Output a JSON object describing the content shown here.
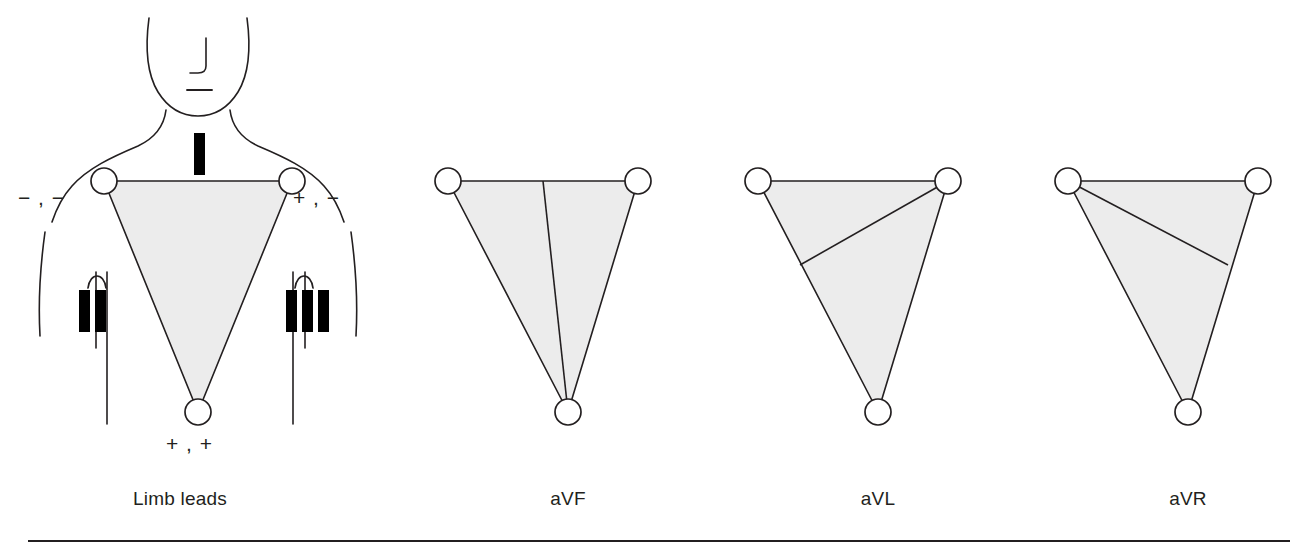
{
  "figure": {
    "background_color": "#ffffff",
    "stroke_color": "#231f20",
    "triangle_fill_color": "#ececec",
    "marker_color": "#000000"
  },
  "panels": [
    {
      "id": "limb-leads",
      "caption": "Limb leads",
      "caption_x": 180,
      "caption_y": 500
    },
    {
      "id": "avf",
      "caption": "aVF",
      "caption_x": 568,
      "caption_y": 500
    },
    {
      "id": "avl",
      "caption": "aVL",
      "caption_x": 878,
      "caption_y": 500
    },
    {
      "id": "avr",
      "caption": "aVR",
      "caption_x": 1188,
      "caption_y": 500
    }
  ],
  "torso": {
    "lead_markers": [
      {
        "name": "lead-I-marker",
        "numeral": "I",
        "bars": 1,
        "position": "upper-chest-center"
      },
      {
        "name": "lead-II-marker",
        "numeral": "II",
        "bars": 2,
        "position": "left-chest"
      },
      {
        "name": "lead-III-marker",
        "numeral": "III",
        "bars": 3,
        "position": "right-chest"
      }
    ],
    "polarity_labels": [
      {
        "name": "polarity-left-arm",
        "text": "− , −",
        "x": 18,
        "y": 196
      },
      {
        "name": "polarity-right-arm",
        "text": "+ , −",
        "x": 293,
        "y": 196
      },
      {
        "name": "polarity-leg",
        "text": "+ , +",
        "x": 536,
        "y": 440
      }
    ],
    "electrodes": [
      {
        "name": "electrode-left-arm",
        "cx": 104,
        "cy": 181
      },
      {
        "name": "electrode-right-arm",
        "cx": 292,
        "cy": 181
      },
      {
        "name": "electrode-leg",
        "cx": 198,
        "cy": 412
      }
    ]
  },
  "triangles": [
    {
      "id": "avf",
      "name": "einthoven-triangle-avf",
      "left_vertex": [
        448,
        181
      ],
      "right_vertex": [
        638,
        181
      ],
      "bottom_vertex": [
        568,
        412
      ],
      "vector_line": {
        "from": [
          543,
          181
        ],
        "to": [
          568,
          412
        ],
        "describes": "aVF axis — top edge midpoint to inferior vertex"
      }
    },
    {
      "id": "avl",
      "name": "einthoven-triangle-avl",
      "left_vertex": [
        758,
        181
      ],
      "right_vertex": [
        948,
        181
      ],
      "bottom_vertex": [
        878,
        412
      ],
      "vector_line": {
        "from": [
          948,
          181
        ],
        "to": [
          800,
          265
        ],
        "describes": "aVL axis — right vertex to left edge midpoint"
      }
    },
    {
      "id": "avr",
      "name": "einthoven-triangle-avr",
      "left_vertex": [
        1068,
        181
      ],
      "right_vertex": [
        1258,
        181
      ],
      "bottom_vertex": [
        1188,
        412
      ],
      "vector_line": {
        "from": [
          1068,
          181
        ],
        "to": [
          1228,
          265
        ],
        "describes": "aVR axis — left vertex to right edge midpoint"
      }
    }
  ],
  "rule": {
    "name": "bottom-divider-rule",
    "x1": 28,
    "y1": 541,
    "x2": 1290,
    "y2": 541
  }
}
